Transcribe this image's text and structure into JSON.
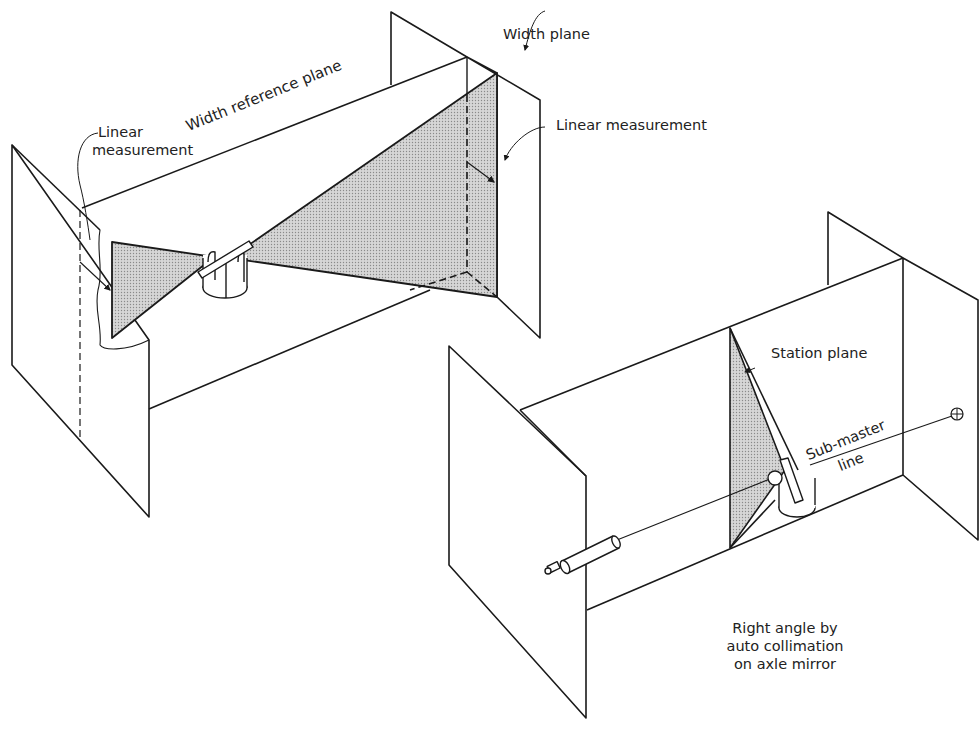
{
  "labels": {
    "linear_measurement_left_line1": "Linear",
    "linear_measurement_left_line2": "measurement",
    "width_reference_plane": "Width reference plane",
    "width_plane": "Width plane",
    "linear_measurement_right": "Linear measurement",
    "station_plane": "Station plane",
    "sub_master_line1": "Sub-master",
    "sub_master_line2": "line",
    "right_angle_line1": "Right angle by",
    "right_angle_line2": "auto collimation",
    "right_angle_line3": "on axle mirror"
  },
  "colors": {
    "stroke": "#1a1a1a",
    "shade": "#c8c8c8",
    "text": "#222222"
  }
}
